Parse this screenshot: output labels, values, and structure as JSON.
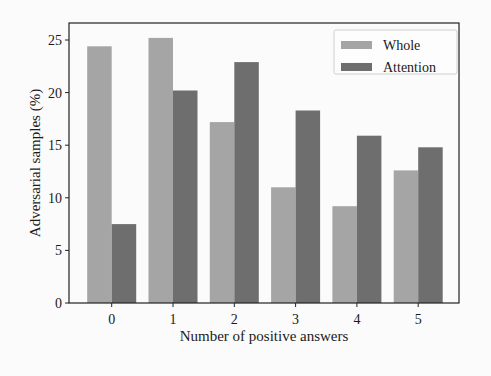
{
  "chart_data": {
    "type": "bar",
    "title": "",
    "xlabel": "Number of positive answers",
    "ylabel": "Adversarial samples (%)",
    "categories": [
      "0",
      "1",
      "2",
      "3",
      "4",
      "5"
    ],
    "series": [
      {
        "name": "Whole",
        "color": "#a5a5a5",
        "values": [
          24.4,
          25.2,
          17.2,
          11.0,
          9.2,
          12.6
        ]
      },
      {
        "name": "Attention",
        "color": "#6e6e6e",
        "values": [
          7.5,
          20.2,
          22.9,
          18.3,
          15.9,
          14.8
        ]
      }
    ],
    "ylim": [
      0,
      26.1
    ],
    "yticks": [
      0,
      5,
      10,
      15,
      20,
      25
    ],
    "grid": false,
    "legend_position": "upper right"
  },
  "layout": {
    "plot": {
      "left": 69,
      "top": 23,
      "right": 459,
      "bottom": 303
    },
    "x_first_tick": 111.7,
    "x_tick_spacing": 61.3,
    "bar_width": 24.5,
    "px_per_unit": 10.52
  }
}
